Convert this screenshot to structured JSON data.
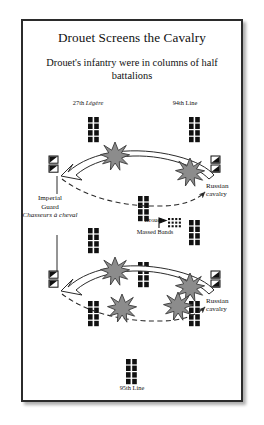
{
  "figure": {
    "title": "Drouet Screens the Cavalry",
    "subtitle": "Drouet's infantry were in columns of half battalions",
    "frame_color": "#2b2b2b",
    "background": "#ffffff"
  },
  "labels": {
    "unit_27th": "27th Légère",
    "unit_27th_main": "27th ",
    "unit_27th_italic": "Légère",
    "unit_94th": "94th Line",
    "unit_95th": "95th Line",
    "imperial_guard_line1": "Imperial",
    "imperial_guard_line2": "Guard",
    "imperial_guard_italic": "Chasseurs à cheval",
    "russian_cavalry_line1": "Russian",
    "russian_cavalry_line2": "cavalry",
    "drouet": "Drouet",
    "massed_bands": "Massed Bands"
  },
  "symbols": {
    "infantry_column": {
      "name": "infantry-column-marker",
      "description": "column of half battalions",
      "fill": "#111111",
      "columns": 2,
      "rows": 4,
      "count": 9
    },
    "friendly_cavalry": {
      "name": "imperial-guard-cavalry-marker",
      "description": "Imperial Guard Chasseurs à cheval",
      "fill": "#111111",
      "count": 2
    },
    "enemy_cavalry": {
      "name": "russian-cavalry-marker",
      "description": "Russian cavalry",
      "fill": "#111111",
      "count": 4
    },
    "burst": {
      "name": "combat-burst",
      "description": "clash / melee burst",
      "fill": "#8c8c8c",
      "stroke": "#3a3a3a",
      "count": 6
    },
    "massed_bands_grid": {
      "name": "massed-bands-marker",
      "fill": "#111111",
      "columns": 4,
      "rows": 3
    },
    "drouet_flag": {
      "name": "drouet-commander-flag",
      "fill": "#111111"
    }
  },
  "arrows": {
    "charge_outline": {
      "name": "cavalry-charge-arrow",
      "style": "hollow outlined arrow",
      "direction": "right-to-left",
      "fill": "#ffffff",
      "stroke": "#2b2b2b",
      "count": 2
    },
    "counter_dashed": {
      "name": "counter-attack-arrow",
      "style": "dashed line with solid head",
      "direction": "left-to-right",
      "stroke": "#2b2b2b",
      "count": 2
    },
    "leader_lines": {
      "name": "label-leader-line",
      "stroke": "#2b2b2b",
      "count": 3
    }
  },
  "scenes": [
    {
      "name": "upper-engagement",
      "infantry": [
        "27th Légère",
        "94th Line"
      ],
      "friendly_cavalry": "Imperial Guard Chasseurs à cheval",
      "enemy_cavalry": "Russian cavalry"
    },
    {
      "name": "lower-engagement",
      "friendly_cavalry": "Imperial Guard Chasseurs à cheval",
      "enemy_cavalry": "Russian cavalry",
      "reserve": "95th Line"
    }
  ]
}
